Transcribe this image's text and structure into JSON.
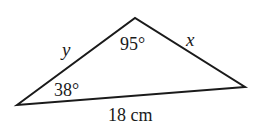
{
  "figure": {
    "type": "triangle",
    "stroke_color": "#1a1a1a",
    "background": "#ffffff",
    "vertices": {
      "left": {
        "x": 17,
        "y": 105
      },
      "top": {
        "x": 135,
        "y": 18
      },
      "right": {
        "x": 245,
        "y": 87
      }
    },
    "angles": {
      "top": "95°",
      "left": "38°"
    },
    "sides": {
      "left_side": "y",
      "right_side": "x",
      "base": "18 cm"
    }
  }
}
